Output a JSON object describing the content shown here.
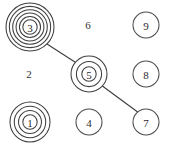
{
  "figure": {
    "kind": "network-diagram",
    "background_color": "#ffffff",
    "stroke_color": "#3f3f3f",
    "text_color": "#2b2b2b",
    "width": 176,
    "height": 147
  },
  "nodes": [
    {
      "id": "node-1",
      "label": "1",
      "cx": 30,
      "cy": 122,
      "radius": 20,
      "rings": 4,
      "style": "concentric"
    },
    {
      "id": "node-2",
      "label": "2",
      "cx": 29,
      "cy": 73,
      "radius": 0,
      "rings": 0,
      "style": "label-only"
    },
    {
      "id": "node-3",
      "label": "3",
      "cx": 30,
      "cy": 27,
      "radius": 24,
      "rings": 6,
      "style": "concentric"
    },
    {
      "id": "node-4",
      "label": "4",
      "cx": 89,
      "cy": 122,
      "radius": 13,
      "rings": 1,
      "style": "plain"
    },
    {
      "id": "node-5",
      "label": "5",
      "cx": 89,
      "cy": 74,
      "radius": 18,
      "rings": 3,
      "style": "concentric"
    },
    {
      "id": "node-6",
      "label": "6",
      "cx": 88,
      "cy": 24,
      "radius": 0,
      "rings": 0,
      "style": "label-only"
    },
    {
      "id": "node-7",
      "label": "7",
      "cx": 146,
      "cy": 122,
      "radius": 13,
      "rings": 1,
      "style": "plain"
    },
    {
      "id": "node-8",
      "label": "8",
      "cx": 146,
      "cy": 74,
      "radius": 13,
      "rings": 1,
      "style": "plain"
    },
    {
      "id": "node-9",
      "label": "9",
      "cx": 146,
      "cy": 25,
      "radius": 13,
      "rings": 1,
      "style": "plain"
    }
  ],
  "edges": [
    {
      "id": "edge-3-5",
      "from": "node-3",
      "to": "node-5",
      "x1": 47,
      "y1": 44,
      "x2": 78,
      "y2": 64
    },
    {
      "id": "edge-5-7",
      "from": "node-5",
      "to": "node-7",
      "x1": 101,
      "y1": 85,
      "x2": 139,
      "y2": 113
    }
  ]
}
